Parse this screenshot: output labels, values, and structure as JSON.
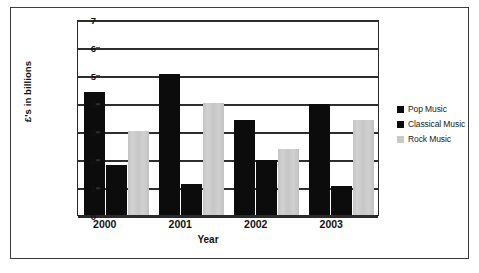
{
  "chart_data": {
    "type": "bar",
    "title": "",
    "subtitle": "",
    "xlabel": "Year",
    "ylabel": "£'s in billions",
    "categories": [
      "2000",
      "2001",
      "2002",
      "2003"
    ],
    "series": [
      {
        "name": "Pop Music",
        "color": "#0c0c0c",
        "values": [
          4.4,
          5.05,
          3.4,
          3.95
        ]
      },
      {
        "name": "Classical Music",
        "color": "#0c0c0c",
        "values": [
          1.8,
          1.1,
          1.95,
          1.05
        ]
      },
      {
        "name": "Rock Music",
        "color": "#c9c9c9",
        "values": [
          3.0,
          4.0,
          2.35,
          3.4
        ]
      }
    ],
    "ylim": [
      0,
      7
    ],
    "ytick_step": 1,
    "yticks": [
      "0",
      "1",
      "2",
      "3",
      "4",
      "5",
      "6",
      "7"
    ],
    "grid": true,
    "grid_axis": "y",
    "legend_position": "right",
    "orientation": "vertical",
    "grouping": "clustered"
  },
  "legend": {
    "items": [
      {
        "label": "Pop Music",
        "swatch": "#0c0c0c"
      },
      {
        "label": "Classical Music",
        "swatch": "#0c0c0c"
      },
      {
        "label": "Rock Music",
        "swatch": "#c9c9c9"
      }
    ]
  },
  "colors": {
    "pop": "#0c0c0c",
    "classical": "#0c0c0c",
    "rock": "#c9c9c9",
    "axis": "#2e2e2e",
    "frame": "#3b3b3b",
    "text": "#111111",
    "background": "#ffffff"
  }
}
